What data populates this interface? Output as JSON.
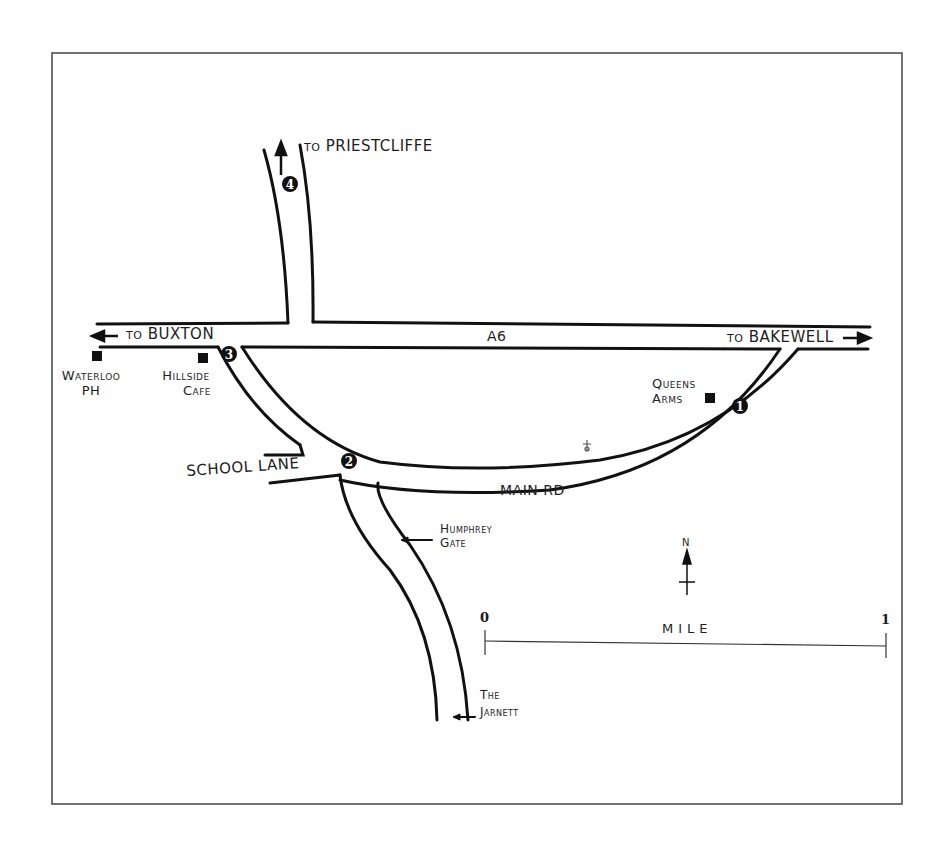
{
  "map": {
    "roads": {
      "a6": "A6",
      "main_rd": "MAIN RD",
      "school_lane": "SCHOOL LANE"
    },
    "directions": {
      "priestcliffe": {
        "prefix": "TO",
        "name": "PRIESTCLIFFE"
      },
      "buxton": {
        "prefix": "TO",
        "name": "BUXTON"
      },
      "bakewell": {
        "prefix": "TO",
        "name": "BAKEWELL"
      }
    },
    "places": {
      "waterloo": [
        "Waterloo",
        "PH"
      ],
      "hillside": [
        "Hillside",
        "Cafe"
      ],
      "queens_arms": [
        "Queens",
        "Arms"
      ],
      "humphrey_gate": [
        "Humphrey",
        "Gate"
      ],
      "the_jarnett": [
        "The",
        "Jarnett"
      ]
    },
    "waypoints": [
      "1",
      "2",
      "3",
      "4"
    ],
    "compass": {
      "label": "N"
    },
    "scale": {
      "start": "0",
      "end": "1",
      "unit": "MILE"
    }
  }
}
